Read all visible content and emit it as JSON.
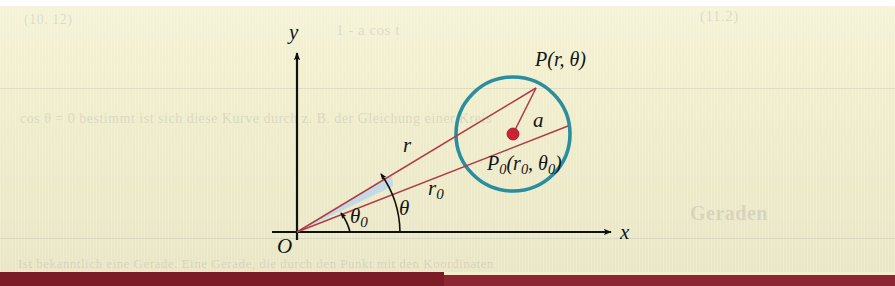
{
  "figure": {
    "kind": "polar-coordinates-circle-diagram",
    "background_color": "#f2efcd",
    "page_color": "#ffffff",
    "bottom_bar_color": "#7c1c26"
  },
  "axes": {
    "x_label": "x",
    "y_label": "y",
    "origin_label": "O",
    "axis_color": "#111111"
  },
  "circle": {
    "stroke_color": "#2a8e9e",
    "center_label_text": "P",
    "center_label_sub": "0",
    "center_label_args": "(r0, θ0)",
    "center_dot_color": "#cc2233",
    "radius_label": "a"
  },
  "points": {
    "p_label": "P(r, θ)",
    "p0_prefix": "P",
    "p0_sub": "0",
    "p0_args_open": "(r",
    "p0_args_sub1": "0",
    "p0_args_mid": ", θ",
    "p0_args_sub2": "0",
    "p0_args_close": ")"
  },
  "segments": {
    "r_label": "r",
    "r0_prefix": "r",
    "r0_sub": "0",
    "a_label": "a",
    "line_color": "#b03a48"
  },
  "angles": {
    "theta_label": "θ",
    "theta0_prefix": "θ",
    "theta0_sub": "0",
    "sector_fill": "#bcd7ea",
    "arc_color": "#111111"
  },
  "ghost": {
    "top_line_1": "(10. 12)",
    "top_line_2": "1 - a cos t",
    "mid_line": "cos θ = 0 bestimmt ist sich diese Kurve durch z. B. der Gleichung einer Kreis",
    "heading": "Geraden",
    "bottom_line": "Ist bekanntlich eine Gerade. Eine Gerade, die durch den Punkt mit den Koordinaten",
    "right_line": "(11.2)"
  }
}
